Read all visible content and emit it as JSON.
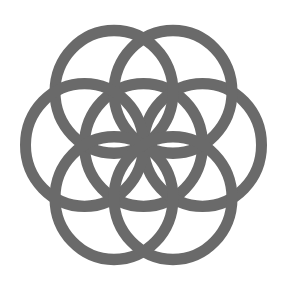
{
  "figure": {
    "name": "Seed of Life",
    "background": "#ffffff",
    "stroke_color": "#6a6a6a",
    "stroke_width": 11,
    "center": [
      143.5,
      145
    ],
    "radius": 59,
    "scale_y": 1.04,
    "circles": [
      {
        "id": "center",
        "angle": null
      },
      {
        "id": "right",
        "angle": 0
      },
      {
        "id": "top-right",
        "angle": 60
      },
      {
        "id": "top-left",
        "angle": 120
      },
      {
        "id": "left",
        "angle": 180
      },
      {
        "id": "bottom-left",
        "angle": 240
      },
      {
        "id": "bottom-right",
        "angle": 300
      }
    ]
  }
}
